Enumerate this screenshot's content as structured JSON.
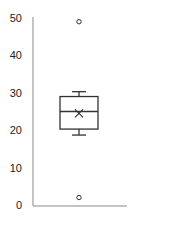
{
  "chart_data": {
    "type": "box",
    "title": "",
    "xlabel": "",
    "ylabel": "",
    "ylim": [
      0,
      50
    ],
    "yticks": [
      0,
      10,
      20,
      30,
      40,
      50
    ],
    "ytick_labels": [
      "0",
      "10",
      "20",
      "30",
      "40",
      "50"
    ],
    "grid": false,
    "legend": null,
    "series": [
      {
        "name": "",
        "whisker_low": 18.7,
        "q1": 20.3,
        "median": 25,
        "mean": 24.5,
        "q3": 29,
        "whisker_high": 30.3,
        "outliers": [
          49,
          2
        ]
      }
    ]
  },
  "colors": {
    "axis": "#888888",
    "box": "#333333",
    "text": "#222222"
  }
}
